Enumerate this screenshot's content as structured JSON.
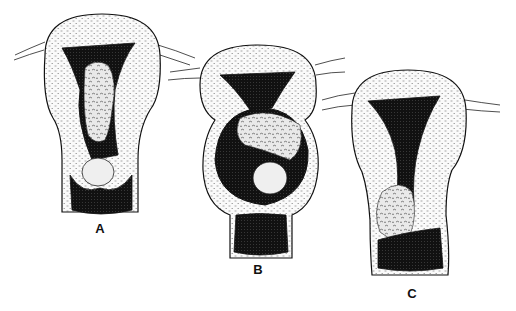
{
  "figure": {
    "panels": [
      {
        "id": "A",
        "label": "A"
      },
      {
        "id": "B",
        "label": "B"
      },
      {
        "id": "C",
        "label": "C"
      }
    ]
  },
  "colors": {
    "ink": "#111111",
    "paper": "#ffffff",
    "wall_stipple": "#f4f4f4",
    "mass": "#e8e8e8"
  }
}
